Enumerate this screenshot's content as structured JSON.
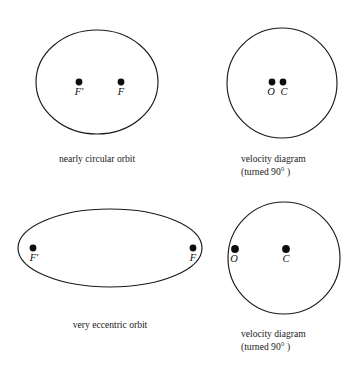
{
  "figure": {
    "background_color": "#ffffff",
    "stroke_color": "#1a1a1a",
    "dot_color": "#0d0d0d",
    "panels": [
      {
        "id": "nearly-circular-orbit",
        "shape": "ellipse",
        "caption_lines": [
          "nearly circular orbit"
        ],
        "points": [
          {
            "id": "f-prime",
            "label": "F′",
            "cx": 79,
            "cy": 82,
            "r": 3.4,
            "label_x": 79,
            "label_y": 95
          },
          {
            "id": "f",
            "label": "F",
            "cx": 121,
            "cy": 82,
            "r": 3.4,
            "label_x": 121,
            "label_y": 95
          }
        ],
        "geometry": {
          "cx": 97,
          "cy": 82,
          "rx": 61,
          "ry": 52
        },
        "caption_x": 97,
        "caption_y": 162
      },
      {
        "id": "velocity-diagram-circular",
        "shape": "ellipse",
        "caption_lines": [
          "velocity diagram",
          "(turned 90° )"
        ],
        "points": [
          {
            "id": "o",
            "label": "O",
            "cx": 272,
            "cy": 82,
            "r": 3.4,
            "label_x": 271,
            "label_y": 95
          },
          {
            "id": "c",
            "label": "C",
            "cx": 283,
            "cy": 82,
            "r": 3.4,
            "label_x": 284,
            "label_y": 95
          }
        ],
        "geometry": {
          "cx": 282,
          "cy": 83,
          "rx": 55,
          "ry": 55
        },
        "caption_x": 289,
        "caption_y": 162
      },
      {
        "id": "very-eccentric-orbit",
        "shape": "ellipse",
        "caption_lines": [
          "very eccentric orbit"
        ],
        "points": [
          {
            "id": "f-prime",
            "label": "F′",
            "cx": 33,
            "cy": 248,
            "r": 3.4,
            "label_x": 34,
            "label_y": 261
          },
          {
            "id": "f",
            "label": "F",
            "cx": 193,
            "cy": 248,
            "r": 3.4,
            "label_x": 193,
            "label_y": 261
          }
        ],
        "geometry": {
          "cx": 110,
          "cy": 248,
          "rx": 92,
          "ry": 39
        },
        "caption_x": 110,
        "caption_y": 328
      },
      {
        "id": "velocity-diagram-eccentric",
        "shape": "ellipse",
        "caption_lines": [
          "velocity diagram",
          "(turned 90° )"
        ],
        "points": [
          {
            "id": "o",
            "label": "O",
            "cx": 235,
            "cy": 249,
            "r": 3.9,
            "label_x": 234,
            "label_y": 262
          },
          {
            "id": "c",
            "label": "C",
            "cx": 286,
            "cy": 249,
            "r": 3.9,
            "label_x": 286,
            "label_y": 262
          }
        ],
        "geometry": {
          "cx": 284,
          "cy": 258,
          "rx": 56,
          "ry": 56
        },
        "caption_x": 289,
        "caption_y": 337
      }
    ]
  }
}
